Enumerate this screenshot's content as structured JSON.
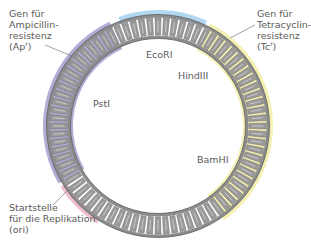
{
  "diagram": {
    "type": "plasmid-map",
    "center": [
      158,
      126
    ],
    "ring": {
      "outer_radius": 110,
      "inner_radius": 89,
      "base_color": "#8c8c8c",
      "rung_color": "#d9d9d9",
      "rungs": 80
    },
    "genes": [
      {
        "id": "ampicillin",
        "label_lines": [
          "Gen für",
          "Ampicillin-",
          "resistenz"
        ],
        "abbrev": "(Ap",
        "sup": "r",
        "close": ")",
        "color": "#aaa4d0",
        "start_deg": 150,
        "end_deg": 245
      },
      {
        "id": "tetracyclin",
        "label_lines": [
          "Gen für",
          "Tetracyclin-",
          "resistenz"
        ],
        "abbrev": "(Tc",
        "sup": "r",
        "close": ")",
        "color": "#f3eeab",
        "start_deg": 297,
        "end_deg": 415
      },
      {
        "id": "ori",
        "label_lines": [
          "Startstelle",
          "für die Replikation",
          "(ori)"
        ],
        "color": "#efb7c6",
        "start_deg": 122,
        "end_deg": 148
      }
    ],
    "sites": [
      {
        "id": "ecori",
        "label": "EcoRI",
        "color": "#a9d4ee",
        "start_deg": 250,
        "end_deg": 295
      },
      {
        "id": "hindiii",
        "label": "HindIII"
      },
      {
        "id": "psti",
        "label": "PstI"
      },
      {
        "id": "bamhi",
        "label": "BamHI"
      }
    ]
  }
}
